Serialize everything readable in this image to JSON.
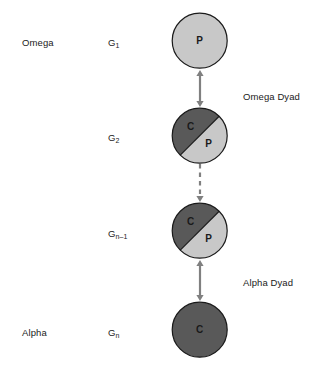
{
  "diagram": {
    "colors": {
      "light_fill": "#c8c8c8",
      "dark_fill": "#595959",
      "outline": "#1a1a1a",
      "arrow": "#808080",
      "text": "#1a1a1a",
      "background": "#ffffff"
    },
    "side_labels": [
      {
        "name": "omega",
        "text": "Omega",
        "x": 22,
        "y": 37
      },
      {
        "name": "alpha",
        "text": "Alpha",
        "x": 22,
        "y": 327
      }
    ],
    "generation_labels": [
      {
        "name": "g1",
        "base": "G",
        "sub": "1",
        "x": 108,
        "y": 37
      },
      {
        "name": "g2",
        "base": "G",
        "sub": "2",
        "x": 108,
        "y": 132
      },
      {
        "name": "gn-1",
        "base": "G",
        "sub": "n–1",
        "x": 108,
        "y": 228
      },
      {
        "name": "gn",
        "base": "G",
        "sub": "n",
        "x": 108,
        "y": 327
      }
    ],
    "dyad_labels": [
      {
        "name": "omega-dyad",
        "text": "Omega Dyad",
        "x": 243,
        "y": 91
      },
      {
        "name": "alpha-dyad",
        "text": "Alpha Dyad",
        "x": 243,
        "y": 277
      }
    ],
    "nodes": [
      {
        "name": "node-g1",
        "generation": "G1",
        "type": "solid-light",
        "cx": 200,
        "cy": 41,
        "r": 27.5,
        "letters": [
          {
            "text": "P",
            "dx": 0,
            "dy": 3.5
          }
        ]
      },
      {
        "name": "node-g2",
        "generation": "G2",
        "type": "split",
        "cx": 200,
        "cy": 135.5,
        "r": 27.5,
        "letters": [
          {
            "text": "C",
            "dx": -9,
            "dy": -6
          },
          {
            "text": "P",
            "dx": 9,
            "dy": 11
          }
        ]
      },
      {
        "name": "node-gn-1",
        "generation": "Gn-1",
        "type": "split",
        "cx": 200,
        "cy": 231,
        "r": 27.5,
        "letters": [
          {
            "text": "C",
            "dx": -9,
            "dy": -6
          },
          {
            "text": "P",
            "dx": 9,
            "dy": 11
          }
        ]
      },
      {
        "name": "node-gn",
        "generation": "Gn",
        "type": "solid-dark",
        "cx": 200,
        "cy": 330,
        "r": 27.5,
        "letters": [
          {
            "text": "C",
            "dx": 0,
            "dy": 3.5
          }
        ]
      }
    ],
    "connectors": [
      {
        "name": "connector-omega-dyad",
        "style": "solid",
        "heads": "both",
        "x": 200,
        "y1": 70,
        "y2": 107
      },
      {
        "name": "connector-ellipsis",
        "style": "dashed",
        "heads": "down",
        "x": 200,
        "y1": 164,
        "y2": 202
      },
      {
        "name": "connector-alpha-dyad",
        "style": "solid",
        "heads": "both",
        "x": 200,
        "y1": 260,
        "y2": 301
      }
    ]
  }
}
